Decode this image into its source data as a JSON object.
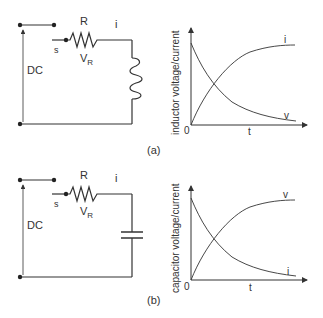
{
  "panels": [
    {
      "caption": "(a)",
      "circuit": {
        "source_label": "DC",
        "switch_label": "s",
        "resistor_label": "R",
        "resistor_voltage_label": "V",
        "resistor_voltage_sub": "R",
        "current_label": "i",
        "element": "inductor"
      },
      "graph": {
        "ylabel": "inductor voltage/current",
        "xlabel": "t",
        "origin_label": "0",
        "rising_label": "i",
        "falling_label": "v"
      }
    },
    {
      "caption": "(b)",
      "circuit": {
        "source_label": "DC",
        "switch_label": "s",
        "resistor_label": "R",
        "resistor_voltage_label": "V",
        "resistor_voltage_sub": "R",
        "current_label": "i",
        "element": "capacitor"
      },
      "graph": {
        "ylabel": "capacitor voltage/current",
        "xlabel": "t",
        "origin_label": "0",
        "rising_label": "v",
        "falling_label": "i"
      }
    }
  ]
}
